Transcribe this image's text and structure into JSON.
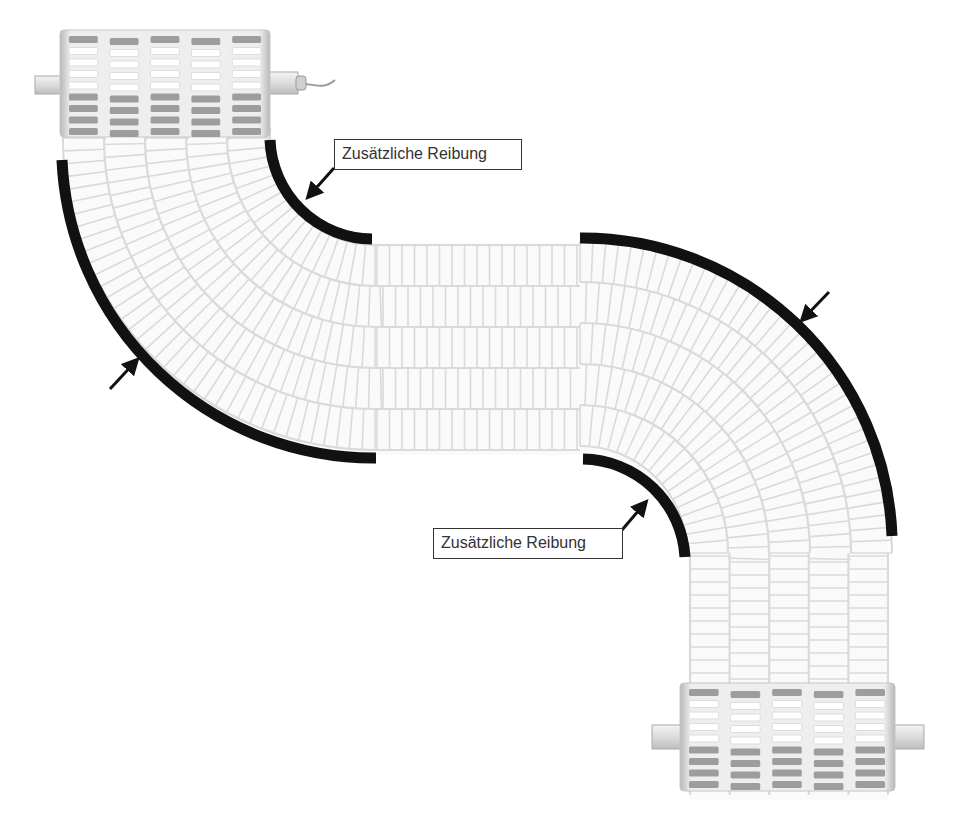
{
  "diagram": {
    "colors": {
      "belt_cell_stroke": "#d8d8d8",
      "belt_cell_fill": "#ffffff",
      "guide_rail": "#111111",
      "roller_body": "#e9e9e9",
      "roller_dark_slot": "#9a9a9a",
      "label_border": "#333333",
      "label_text": "#333333"
    },
    "components": [
      {
        "id": "drive-roller-top",
        "type": "roller",
        "has_cable": true
      },
      {
        "id": "drive-roller-bottom",
        "type": "roller",
        "has_cable": false
      },
      {
        "id": "belt",
        "type": "modular-belt",
        "lanes": 5
      },
      {
        "id": "rail-left-outer",
        "type": "guide-rail"
      },
      {
        "id": "rail-left-inner",
        "type": "guide-rail"
      },
      {
        "id": "rail-right-outer",
        "type": "guide-rail"
      },
      {
        "id": "rail-right-inner",
        "type": "guide-rail"
      }
    ],
    "annotations": [
      {
        "id": "label-top",
        "text": "Zusätzliche Reibung"
      },
      {
        "id": "label-bottom",
        "text": "Zusätzliche Reibung"
      }
    ],
    "unlabeled_arrows": 2
  }
}
